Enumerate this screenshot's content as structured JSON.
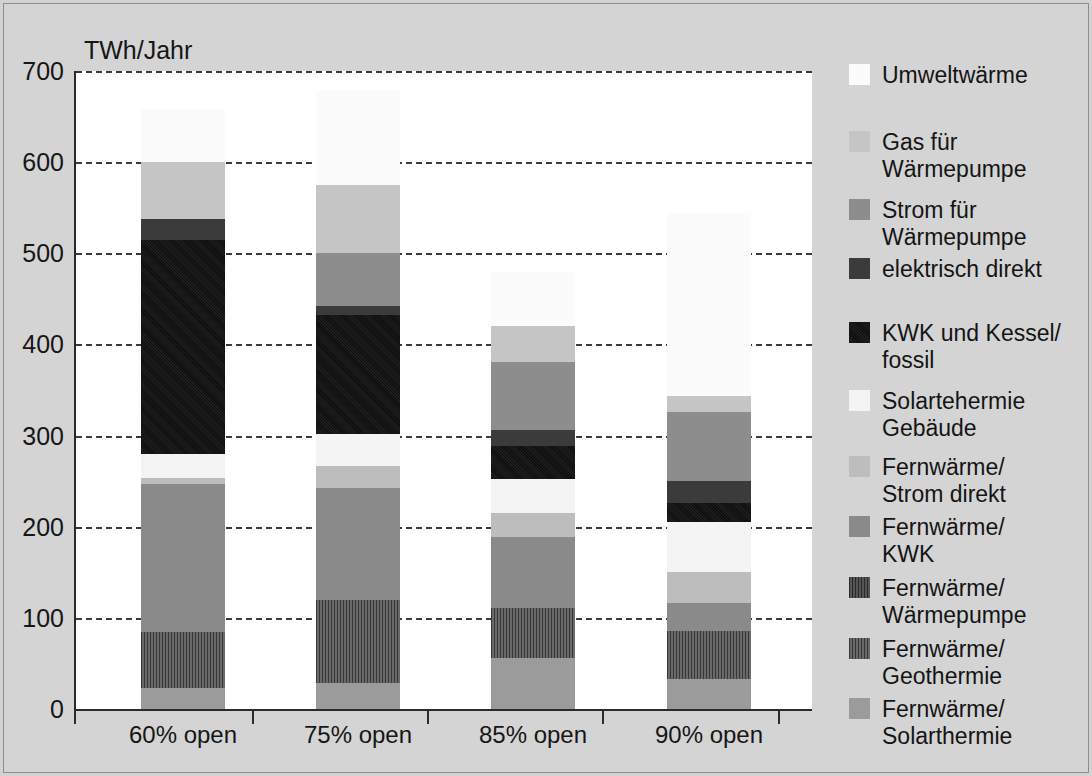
{
  "axis": {
    "y_unit_label": "TWh/Jahr",
    "y_ticks": [
      "700",
      "600",
      "500",
      "400",
      "300",
      "200",
      "100",
      "0"
    ],
    "y_tick_values": [
      700,
      600,
      500,
      400,
      300,
      200,
      100,
      0
    ],
    "x_labels": [
      "60%\nopen",
      "75%\nopen",
      "85%\nopen",
      "90%\nopen"
    ]
  },
  "legend": {
    "items": [
      {
        "label": "Umweltwärme",
        "color": "#fbfbfb"
      },
      {
        "label": "Gas für\nWärmepumpe",
        "color": "#c5c5c5"
      },
      {
        "label": "Strom für\nWärmepumpe",
        "color": "#8d8d8d"
      },
      {
        "label": "elektrisch direkt",
        "color": "#3b3b3b"
      },
      {
        "label": "KWK und Kessel/\nfossil",
        "color": "#121212"
      },
      {
        "label": "Solartehermie\nGebäude",
        "color": "#f4f4f4"
      },
      {
        "label": "Fernwärme/\nStrom direkt",
        "color": "#bdbdbd"
      },
      {
        "label": "Fernwärme/\nKWK",
        "color": "#8a8a8a"
      },
      {
        "label": "Fernwärme/\nWärmepumpe",
        "color": "#3e3e3e"
      },
      {
        "label": "Fernwärme/\nGeothermie",
        "color": "#4d4d4d"
      },
      {
        "label": "Fernwärme/\nSolarthermie",
        "color": "#9b9b9b"
      }
    ]
  },
  "chart_data": {
    "type": "bar",
    "subtype": "stacked",
    "title": "",
    "xlabel": "",
    "ylabel": "TWh/Jahr",
    "ylim": [
      0,
      700
    ],
    "ytick_step": 100,
    "grid": true,
    "legend_position": "right",
    "categories": [
      "60% open",
      "75% open",
      "85% open",
      "90% open"
    ],
    "series": [
      {
        "name": "Fernwärme/Solarthermie",
        "color": "#9b9b9b",
        "values": [
          23,
          28,
          56,
          33
        ]
      },
      {
        "name": "Fernwärme/Geothermie",
        "color": "#4d4d4d",
        "values": [
          61,
          92,
          55,
          53
        ]
      },
      {
        "name": "Fernwärme/Wärmepumpe",
        "color": "#3e3e3e",
        "values": [
          0,
          0,
          0,
          0
        ]
      },
      {
        "name": "Fernwärme/KWK",
        "color": "#8a8a8a",
        "values": [
          163,
          122,
          78,
          30
        ]
      },
      {
        "name": "Fernwärme/Strom direkt",
        "color": "#bdbdbd",
        "values": [
          6,
          25,
          37,
          34
        ]
      },
      {
        "name": "Solartehermie Gebäude",
        "color": "#f4f4f4",
        "values": [
          27,
          25,
          26,
          55
        ]
      },
      {
        "name": "KWK und Kessel/fossil",
        "color": "#121212",
        "values": [
          235,
          130,
          37,
          16
        ]
      },
      {
        "name": "elektrisch direkt",
        "color": "#3b3b3b",
        "values": [
          23,
          10,
          18,
          24
        ]
      },
      {
        "name": "Strom für Wärmepumpe",
        "color": "#8d8d8d",
        "values": [
          0,
          58,
          75,
          76
        ]
      },
      {
        "name": "Gas für Wärmepumpe",
        "color": "#c5c5c5",
        "values": [
          62,
          75,
          39,
          17
        ]
      },
      {
        "name": "Umweltwärme",
        "color": "#fbfbfb",
        "values": [
          58,
          104,
          60,
          201
        ]
      }
    ],
    "totals": [
      658,
      679,
      480,
      544
    ]
  },
  "bars": [
    {
      "name": "60% open",
      "x": 141,
      "segments": [
        {
          "series": "Umweltwärme",
          "color": "#fbfbfb",
          "top_value": 658,
          "bottom_value": 600
        },
        {
          "series": "Gas für Wärmepumpe",
          "color": "#c5c5c5",
          "top_value": 600,
          "bottom_value": 538
        },
        {
          "series": "Strom für Wärmepumpe",
          "color": "#8d8d8d",
          "top_value": 538,
          "bottom_value": 538
        },
        {
          "series": "elektrisch direkt",
          "color": "#3b3b3b",
          "top_value": 538,
          "bottom_value": 515
        },
        {
          "series": "KWK und Kessel/fossil",
          "color": "#121212",
          "top_value": 515,
          "bottom_value": 280
        },
        {
          "series": "Solartehermie Gebäude",
          "color": "#f4f4f4",
          "top_value": 280,
          "bottom_value": 253
        },
        {
          "series": "Fernwärme/Strom direkt",
          "color": "#bdbdbd",
          "top_value": 253,
          "bottom_value": 247
        },
        {
          "series": "Fernwärme/KWK",
          "color": "#8a8a8a",
          "top_value": 247,
          "bottom_value": 84
        },
        {
          "series": "Fernwärme/Geothermie",
          "color": "#4d4d4d",
          "top_value": 84,
          "bottom_value": 23
        },
        {
          "series": "Fernwärme/Solarthermie",
          "color": "#9b9b9b",
          "top_value": 23,
          "bottom_value": 0
        }
      ]
    },
    {
      "name": "75% open",
      "x": 316,
      "segments": [
        {
          "series": "Umweltwärme",
          "color": "#fbfbfb",
          "top_value": 679,
          "bottom_value": 575
        },
        {
          "series": "Gas für Wärmepumpe",
          "color": "#c5c5c5",
          "top_value": 575,
          "bottom_value": 500
        },
        {
          "series": "Strom für Wärmepumpe",
          "color": "#8d8d8d",
          "top_value": 500,
          "bottom_value": 442
        },
        {
          "series": "elektrisch direkt",
          "color": "#3b3b3b",
          "top_value": 442,
          "bottom_value": 432
        },
        {
          "series": "KWK und Kessel/fossil",
          "color": "#121212",
          "top_value": 432,
          "bottom_value": 302
        },
        {
          "series": "Solartehermie Gebäude",
          "color": "#f4f4f4",
          "top_value": 302,
          "bottom_value": 267
        },
        {
          "series": "Fernwärme/Strom direkt",
          "color": "#bdbdbd",
          "top_value": 267,
          "bottom_value": 242
        },
        {
          "series": "Fernwärme/KWK",
          "color": "#8a8a8a",
          "top_value": 242,
          "bottom_value": 120
        },
        {
          "series": "Fernwärme/Geothermie",
          "color": "#4d4d4d",
          "top_value": 120,
          "bottom_value": 28
        },
        {
          "series": "Fernwärme/Solarthermie",
          "color": "#9b9b9b",
          "top_value": 28,
          "bottom_value": 0
        }
      ]
    },
    {
      "name": "85% open",
      "x": 491,
      "segments": [
        {
          "series": "Umweltwärme",
          "color": "#fbfbfb",
          "top_value": 480,
          "bottom_value": 420
        },
        {
          "series": "Gas für Wärmepumpe",
          "color": "#c5c5c5",
          "top_value": 420,
          "bottom_value": 381
        },
        {
          "series": "Strom für Wärmepumpe",
          "color": "#8d8d8d",
          "top_value": 381,
          "bottom_value": 306
        },
        {
          "series": "elektrisch direkt",
          "color": "#3b3b3b",
          "top_value": 306,
          "bottom_value": 288
        },
        {
          "series": "KWK und Kessel/fossil",
          "color": "#121212",
          "top_value": 288,
          "bottom_value": 252
        },
        {
          "series": "Solartehermie Gebäude",
          "color": "#f4f4f4",
          "top_value": 252,
          "bottom_value": 215
        },
        {
          "series": "Fernwärme/Strom direkt",
          "color": "#bdbdbd",
          "top_value": 215,
          "bottom_value": 189
        },
        {
          "series": "Fernwärme/KWK",
          "color": "#8a8a8a",
          "top_value": 189,
          "bottom_value": 111
        },
        {
          "series": "Fernwärme/Geothermie",
          "color": "#4d4d4d",
          "top_value": 111,
          "bottom_value": 56
        },
        {
          "series": "Fernwärme/Solarthermie",
          "color": "#9b9b9b",
          "top_value": 56,
          "bottom_value": 0
        }
      ]
    },
    {
      "name": "90% open",
      "x": 667,
      "segments": [
        {
          "series": "Umweltwärme",
          "color": "#fbfbfb",
          "top_value": 544,
          "bottom_value": 343
        },
        {
          "series": "Gas für Wärmepumpe",
          "color": "#c5c5c5",
          "top_value": 343,
          "bottom_value": 326
        },
        {
          "series": "Strom für Wärmepumpe",
          "color": "#8d8d8d",
          "top_value": 326,
          "bottom_value": 250
        },
        {
          "series": "elektrisch direkt",
          "color": "#3b3b3b",
          "top_value": 250,
          "bottom_value": 226
        },
        {
          "series": "KWK und Kessel/fossil",
          "color": "#121212",
          "top_value": 226,
          "bottom_value": 205
        },
        {
          "series": "Solartehermie Gebäude",
          "color": "#f4f4f4",
          "top_value": 205,
          "bottom_value": 150
        },
        {
          "series": "Fernwärme/Strom direkt",
          "color": "#bdbdbd",
          "top_value": 150,
          "bottom_value": 116
        },
        {
          "series": "Fernwärme/KWK",
          "color": "#8a8a8a",
          "top_value": 116,
          "bottom_value": 86
        },
        {
          "series": "Fernwärme/Geothermie",
          "color": "#4d4d4d",
          "top_value": 86,
          "bottom_value": 33
        },
        {
          "series": "Fernwärme/Solarthermie",
          "color": "#9b9b9b",
          "top_value": 33,
          "bottom_value": 0
        }
      ]
    }
  ]
}
